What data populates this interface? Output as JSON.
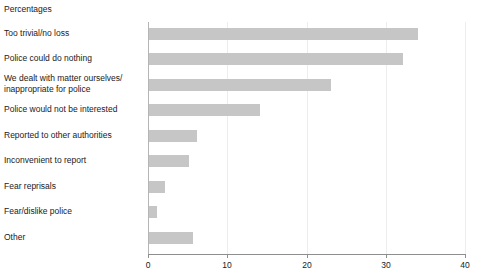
{
  "chart_data": {
    "type": "bar",
    "orientation": "horizontal",
    "title": "Percentages",
    "xlabel": "",
    "ylabel": "",
    "xlim": [
      0,
      40
    ],
    "xticks": [
      0,
      10,
      20,
      30,
      40
    ],
    "xtick_labels": [
      "0",
      "10",
      "20",
      "30",
      "40"
    ],
    "grid": true,
    "grid_axis": "x",
    "legend": false,
    "bar_color": "#c6c6c6",
    "categories": [
      "Too trivial/no loss",
      "Police could do nothing",
      "We dealt with matter ourselves/ inappropriate for police",
      "Police would not be interested",
      "Reported to other authorities",
      "Inconvenient to report",
      "Fear reprisals",
      "Fear/dislike police",
      "Other"
    ],
    "values": [
      34,
      32,
      23,
      14,
      6,
      5,
      2,
      1,
      5.5
    ]
  },
  "labels": {
    "title": "Percentages",
    "cat_0_line_0": "Too trivial/no loss",
    "cat_1_line_0": "Police could do nothing",
    "cat_2_line_0": "We dealt with matter ourselves/",
    "cat_2_line_1": "inappropriate for police",
    "cat_3_line_0": "Police would not be interested",
    "cat_4_line_0": "Reported to other authorities",
    "cat_5_line_0": "Inconvenient to report",
    "cat_6_line_0": "Fear reprisals",
    "cat_7_line_0": "Fear/dislike police",
    "cat_8_line_0": "Other",
    "tick_0": "0",
    "tick_1": "10",
    "tick_2": "20",
    "tick_3": "30",
    "tick_4": "40"
  }
}
